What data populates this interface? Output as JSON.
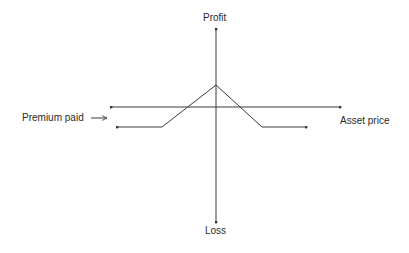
{
  "diagram": {
    "type": "option-payoff",
    "labels": {
      "y_positive": "Profit",
      "y_negative": "Loss",
      "x_axis": "Asset price",
      "premium": "Premium paid"
    },
    "colors": {
      "line": "#3a3a3a",
      "text": "#2a2a2a",
      "background": "#ffffff"
    },
    "payoff_shape": "short-strangle / inverted-V payoff: flat loss at premium level, rising to a peak profit at the center, falling back to the flat loss"
  }
}
